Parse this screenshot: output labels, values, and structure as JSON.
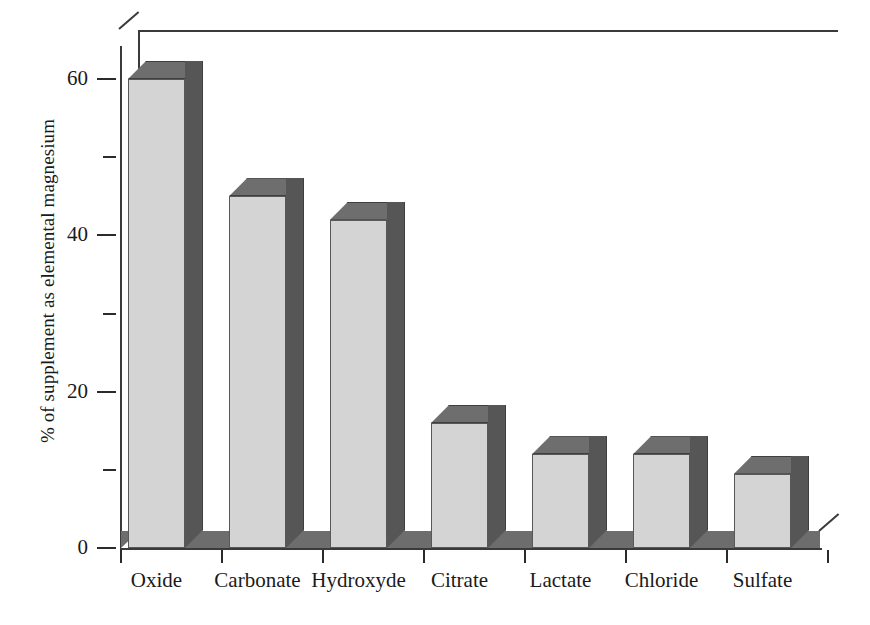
{
  "chart_data": {
    "type": "bar",
    "title": "",
    "xlabel": "",
    "ylabel": "% of supplement as elemental magnesium",
    "categories": [
      "Oxide",
      "Carbonate",
      "Hydroxyde",
      "Citrate",
      "Lactate",
      "Chloride",
      "Sulfate"
    ],
    "values": [
      60,
      45,
      42,
      16,
      12,
      12,
      9.5
    ],
    "ylim": [
      0,
      65
    ],
    "y_major_ticks": [
      0,
      20,
      40,
      60
    ],
    "y_minor_ticks": [
      10,
      30,
      50
    ],
    "y_tick_labels": [
      "0",
      "20",
      "40",
      "60"
    ],
    "grid": false,
    "legend": false,
    "style": "3d-column",
    "colors": {
      "bar_front": "#d4d4d4",
      "bar_side": "#565656",
      "bar_top": "#6e6e6e",
      "floor": "#6d6d6d",
      "axis": "#3a3a3a",
      "text": "#1a1a1a"
    }
  }
}
